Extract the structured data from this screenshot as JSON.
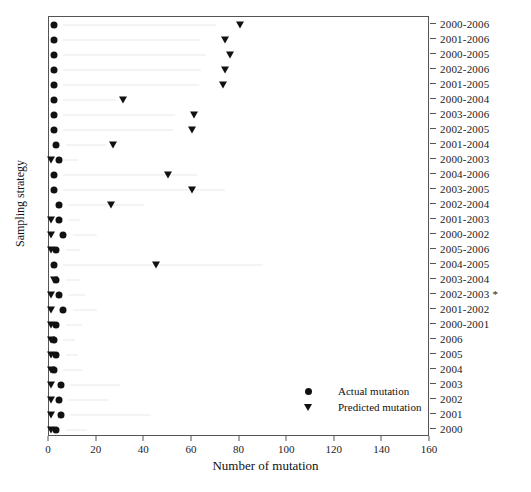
{
  "chart_data": {
    "type": "scatter",
    "title": "",
    "xlabel": "Number of mutation",
    "ylabel": "Sampling strategy",
    "xlim": [
      0,
      160
    ],
    "xticks": [
      0,
      20,
      40,
      60,
      80,
      100,
      120,
      140,
      160
    ],
    "grid": false,
    "legend_position": "bottom-right",
    "series": [
      {
        "name": "Actual mutation",
        "marker": "circle"
      },
      {
        "name": "Predicted mutation",
        "marker": "triangle-down"
      }
    ],
    "categories": [
      "2000-2006",
      "2001-2006",
      "2000-2005",
      "2002-2006",
      "2001-2005",
      "2000-2004",
      "2003-2006",
      "2002-2005",
      "2001-2004",
      "2000-2003",
      "2004-2006",
      "2003-2005",
      "2002-2004",
      "2001-2003",
      "2000-2002",
      "2005-2006",
      "2004-2005",
      "2003-2004",
      "2002-2003 *",
      "2001-2002",
      "2000-2001",
      "2006",
      "2005",
      "2004",
      "2003",
      "2002",
      "2001",
      "2000"
    ],
    "rows": [
      {
        "category": "2000-2006",
        "actual": 2,
        "predicted": 80,
        "range_start": 6,
        "range_end": 70
      },
      {
        "category": "2001-2006",
        "actual": 2,
        "predicted": 74,
        "range_start": 6,
        "range_end": 64
      },
      {
        "category": "2000-2005",
        "actual": 2,
        "predicted": 76,
        "range_start": 6,
        "range_end": 66
      },
      {
        "category": "2002-2006",
        "actual": 2,
        "predicted": 74,
        "range_start": 6,
        "range_end": 64
      },
      {
        "category": "2001-2005",
        "actual": 2,
        "predicted": 73,
        "range_start": 6,
        "range_end": 63
      },
      {
        "category": "2000-2004",
        "actual": 2,
        "predicted": 31,
        "range_start": 6,
        "range_end": 28
      },
      {
        "category": "2003-2006",
        "actual": 2,
        "predicted": 61,
        "range_start": 6,
        "range_end": 53
      },
      {
        "category": "2002-2005",
        "actual": 2,
        "predicted": 60,
        "range_start": 6,
        "range_end": 52
      },
      {
        "category": "2001-2004",
        "actual": 3,
        "predicted": 27,
        "range_start": 7,
        "range_end": 24
      },
      {
        "category": "2000-2003",
        "actual": 4,
        "predicted": 1,
        "range_start": 6,
        "range_end": 12
      },
      {
        "category": "2004-2006",
        "actual": 2,
        "predicted": 50,
        "range_start": 6,
        "range_end": 62
      },
      {
        "category": "2003-2005",
        "actual": 2,
        "predicted": 60,
        "range_start": 6,
        "range_end": 74
      },
      {
        "category": "2002-2004",
        "actual": 4,
        "predicted": 26,
        "range_start": 8,
        "range_end": 40
      },
      {
        "category": "2001-2003",
        "actual": 4,
        "predicted": 1,
        "range_start": 8,
        "range_end": 13
      },
      {
        "category": "2000-2002",
        "actual": 6,
        "predicted": 1,
        "range_start": 10,
        "range_end": 20
      },
      {
        "category": "2005-2006",
        "actual": 3,
        "predicted": 1,
        "range_start": 7,
        "range_end": 13
      },
      {
        "category": "2004-2005",
        "actual": 2,
        "predicted": 45,
        "range_start": 6,
        "range_end": 90
      },
      {
        "category": "2003-2004",
        "actual": 3,
        "predicted": 2,
        "range_start": 7,
        "range_end": 13
      },
      {
        "category": "2002-2003 *",
        "actual": 4,
        "predicted": 1,
        "range_start": 8,
        "range_end": 15
      },
      {
        "category": "2001-2002",
        "actual": 6,
        "predicted": 1,
        "range_start": 10,
        "range_end": 20
      },
      {
        "category": "2000-2001",
        "actual": 3,
        "predicted": 1,
        "range_start": 7,
        "range_end": 14
      },
      {
        "category": "2006",
        "actual": 2,
        "predicted": 1,
        "range_start": 6,
        "range_end": 11
      },
      {
        "category": "2005",
        "actual": 3,
        "predicted": 1,
        "range_start": 7,
        "range_end": 12
      },
      {
        "category": "2004",
        "actual": 2,
        "predicted": 1,
        "range_start": 6,
        "range_end": 14
      },
      {
        "category": "2003",
        "actual": 5,
        "predicted": 1,
        "range_start": 9,
        "range_end": 30
      },
      {
        "category": "2002",
        "actual": 4,
        "predicted": 1,
        "range_start": 8,
        "range_end": 25
      },
      {
        "category": "2001",
        "actual": 5,
        "predicted": 1,
        "range_start": 9,
        "range_end": 43
      },
      {
        "category": "2000",
        "actual": 3,
        "predicted": 1,
        "range_start": 7,
        "range_end": 16
      }
    ]
  },
  "legend": {
    "actual_label": "Actual mutation",
    "predicted_label": "Predicted mutation"
  },
  "axes": {
    "x_title": "Number of mutation",
    "y_title": "Sampling strategy"
  },
  "colors": {
    "marker": "#111111",
    "axis": "#555555",
    "range_line": "#e9e9e9",
    "background": "#ffffff"
  }
}
